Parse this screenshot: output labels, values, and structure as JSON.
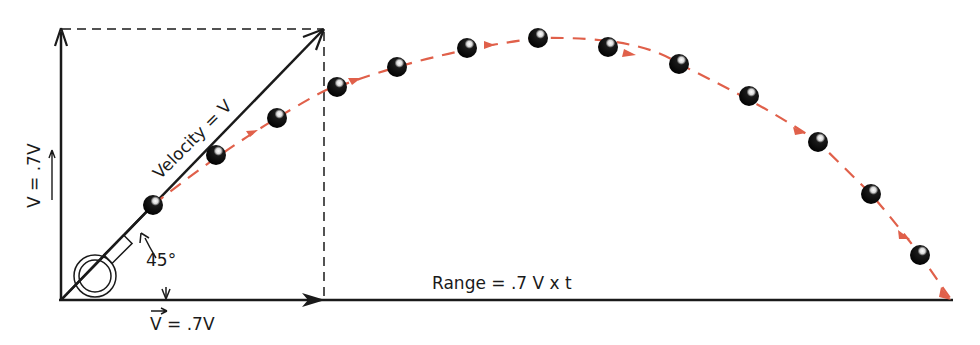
{
  "diagram": {
    "colors": {
      "ink": "#1a1a1a",
      "trajectory": "#e0604a",
      "ball": "#0d0d0d",
      "background": "#ffffff"
    },
    "labels": {
      "velocity": "Velocity = V",
      "angle": "45°",
      "horizontal_component": "V = .7V",
      "vertical_component": "V = .7V",
      "range": "Range = .7 V x t"
    },
    "icons": {
      "launcher": "cannon-ring-icon",
      "ball": "ball-icon",
      "arrow": "arrowhead-icon"
    },
    "trajectory_points": [
      [
        153,
        205
      ],
      [
        216,
        155
      ],
      [
        277,
        118
      ],
      [
        337,
        87
      ],
      [
        397,
        67
      ],
      [
        467,
        48
      ],
      [
        538,
        38
      ],
      [
        608,
        47
      ],
      [
        679,
        64
      ],
      [
        749,
        96
      ],
      [
        818,
        142
      ],
      [
        871,
        194
      ],
      [
        920,
        255
      ]
    ],
    "trajectory_end": [
      950,
      298
    ],
    "ball_count": 13
  }
}
